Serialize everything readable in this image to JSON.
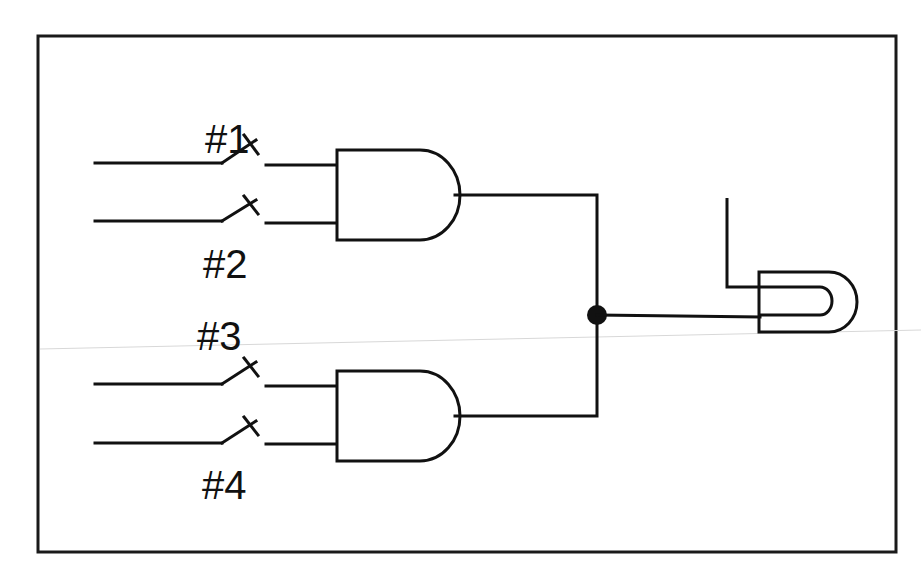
{
  "diagram": {
    "type": "logic-circuit",
    "switches": [
      {
        "id": 1,
        "label": "#1"
      },
      {
        "id": 2,
        "label": "#2"
      },
      {
        "id": 3,
        "label": "#3"
      },
      {
        "id": 4,
        "label": "#4"
      }
    ],
    "gates": [
      {
        "id": "and-1",
        "type": "AND",
        "inputs": [
          "#1",
          "#2"
        ]
      },
      {
        "id": "and-2",
        "type": "AND",
        "inputs": [
          "#3",
          "#4"
        ]
      }
    ],
    "output": {
      "type": "lamp",
      "junction": "node joining AND gate outputs"
    },
    "colors": {
      "ink": "#111111",
      "background": "#ffffff"
    }
  }
}
